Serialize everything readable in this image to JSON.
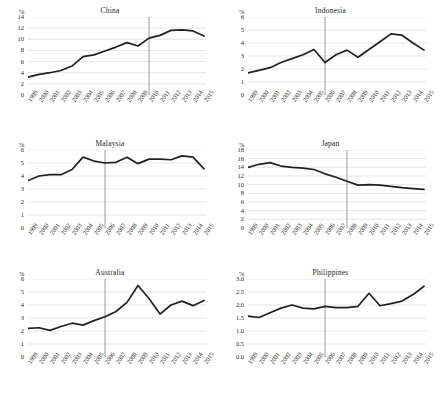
{
  "figure": {
    "unit_label": "%",
    "panel_count": 6,
    "line_color": "#231f20",
    "grid_color": "#d4d4d4",
    "marker_color": "#8f8f8f",
    "background": "#ffffff"
  },
  "chart_data": [
    {
      "type": "line",
      "title": "China",
      "xlabel": "",
      "ylabel": "%",
      "grid": true,
      "legend": null,
      "ylim": [
        0,
        14
      ],
      "yticks": [
        "0",
        "2",
        "4",
        "6",
        "8",
        "10",
        "12",
        "14"
      ],
      "x": [
        "1999",
        "2000",
        "2001",
        "2002",
        "2003",
        "2004",
        "2005",
        "2006",
        "2007",
        "2008",
        "2009",
        "2010",
        "2011",
        "2012",
        "2013",
        "2014",
        "2015"
      ],
      "values": [
        3.2,
        3.7,
        4.0,
        4.4,
        5.2,
        6.9,
        7.2,
        7.9,
        8.6,
        9.4,
        8.8,
        10.2,
        10.7,
        11.6,
        11.7,
        11.5,
        10.6,
        10.6
      ],
      "annotations": [
        {
          "type": "vertical-line",
          "x": "2010"
        }
      ]
    },
    {
      "type": "line",
      "title": "Indonesia",
      "xlabel": "",
      "ylabel": "%",
      "grid": true,
      "legend": null,
      "ylim": [
        0,
        6
      ],
      "yticks": [
        "0",
        "1",
        "2",
        "3",
        "4",
        "5",
        "6"
      ],
      "x": [
        "1999",
        "2000",
        "2001",
        "2002",
        "2003",
        "2004",
        "2005",
        "2006",
        "2007",
        "2008",
        "2009",
        "2010",
        "2011",
        "2012",
        "2013",
        "2014",
        "2015"
      ],
      "values": [
        1.7,
        1.9,
        2.1,
        2.5,
        2.8,
        3.1,
        3.5,
        2.5,
        3.1,
        3.45,
        2.9,
        3.5,
        4.1,
        4.7,
        4.6,
        4.0,
        3.45
      ],
      "annotations": [
        {
          "type": "vertical-line",
          "x": "2006"
        }
      ]
    },
    {
      "type": "line",
      "title": "Malaysia",
      "xlabel": "",
      "ylabel": "%",
      "grid": true,
      "legend": null,
      "ylim": [
        0,
        6
      ],
      "yticks": [
        "0",
        "1",
        "2",
        "3",
        "4",
        "5",
        "6"
      ],
      "x": [
        "1999",
        "2000",
        "2001",
        "2002",
        "2003",
        "2004",
        "2005",
        "2006",
        "2007",
        "2008",
        "2009",
        "2010",
        "2011",
        "2012",
        "2013",
        "2014",
        "2015"
      ],
      "values": [
        3.65,
        4.0,
        4.1,
        4.1,
        4.5,
        5.45,
        5.15,
        5.0,
        5.05,
        5.45,
        4.95,
        5.3,
        5.3,
        5.25,
        5.55,
        5.45,
        4.55
      ],
      "annotations": [
        {
          "type": "vertical-line",
          "x": "2006"
        }
      ]
    },
    {
      "type": "line",
      "title": "Japan",
      "xlabel": "",
      "ylabel": "%",
      "grid": true,
      "legend": null,
      "ylim": [
        0,
        18
      ],
      "yticks": [
        "0",
        "2",
        "4",
        "6",
        "8",
        "10",
        "12",
        "14",
        "16",
        "18"
      ],
      "x": [
        "1999",
        "2000",
        "2001",
        "2002",
        "2003",
        "2004",
        "2005",
        "2006",
        "2007",
        "2008",
        "2009",
        "2010",
        "2011",
        "2012",
        "2013",
        "2014",
        "2015"
      ],
      "values": [
        14.0,
        14.7,
        15.1,
        14.3,
        14.0,
        13.8,
        13.5,
        12.5,
        11.7,
        10.8,
        9.9,
        10.0,
        9.9,
        9.6,
        9.3,
        9.1,
        8.9
      ],
      "annotations": [
        {
          "type": "vertical-line",
          "x": "2008"
        }
      ]
    },
    {
      "type": "line",
      "title": "Australia",
      "xlabel": "",
      "ylabel": "%",
      "grid": true,
      "legend": null,
      "ylim": [
        0,
        6
      ],
      "yticks": [
        "0",
        "1",
        "2",
        "3",
        "4",
        "5",
        "6"
      ],
      "x": [
        "1999",
        "2000",
        "2001",
        "2002",
        "2003",
        "2004",
        "2005",
        "2006",
        "2007",
        "2008",
        "2009",
        "2010",
        "2011",
        "2012",
        "2013",
        "2014",
        "2015"
      ],
      "values": [
        2.2,
        2.25,
        2.05,
        2.35,
        2.6,
        2.45,
        2.8,
        3.1,
        3.5,
        4.2,
        5.5,
        4.5,
        3.3,
        4.0,
        4.3,
        3.95,
        4.35
      ],
      "annotations": [
        {
          "type": "vertical-line",
          "x": "2006"
        }
      ]
    },
    {
      "type": "line",
      "title": "Philippines",
      "xlabel": "",
      "ylabel": "%",
      "grid": true,
      "legend": null,
      "ylim": [
        0.0,
        3.0
      ],
      "yticks": [
        "0.0",
        "0.5",
        "1.0",
        "1.5",
        "2.0",
        "2.5",
        "3.0"
      ],
      "x": [
        "1999",
        "2000",
        "2001",
        "2002",
        "2003",
        "2004",
        "2005",
        "2006",
        "2007",
        "2008",
        "2009",
        "2010",
        "2011",
        "2012",
        "2013",
        "2014",
        "2015"
      ],
      "values": [
        1.57,
        1.52,
        1.7,
        1.88,
        2.0,
        1.88,
        1.85,
        1.95,
        1.9,
        1.9,
        1.95,
        2.45,
        1.97,
        2.05,
        2.15,
        2.4,
        2.72
      ],
      "annotations": [
        {
          "type": "vertical-line",
          "x": "2006"
        }
      ]
    }
  ]
}
